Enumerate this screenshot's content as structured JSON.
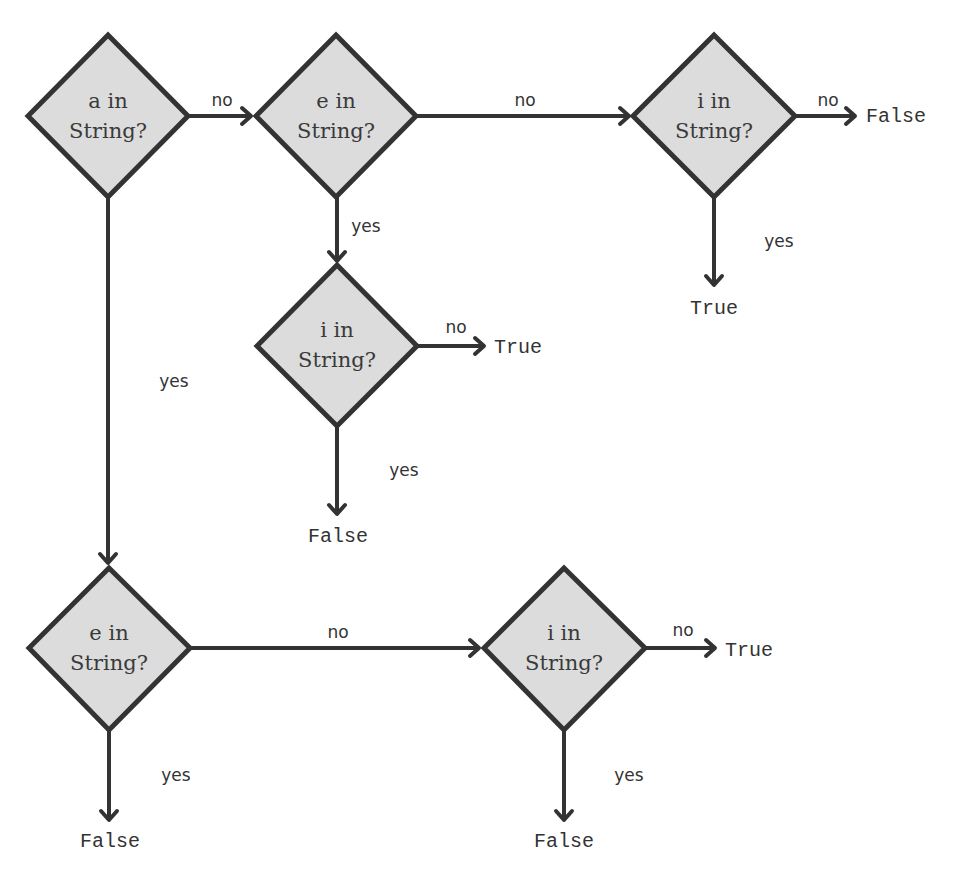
{
  "diagram": {
    "type": "flowchart",
    "colors": {
      "node_fill": "#dcdcdc",
      "node_stroke": "#333333",
      "edge": "#333333",
      "text": "#333333"
    },
    "nodes": [
      {
        "id": "n1",
        "line1": "a in",
        "line2": "String?"
      },
      {
        "id": "n2",
        "line1": "e in",
        "line2": "String?"
      },
      {
        "id": "n3",
        "line1": "i in",
        "line2": "String?"
      },
      {
        "id": "n4",
        "line1": "i in",
        "line2": "String?"
      },
      {
        "id": "n5",
        "line1": "e in",
        "line2": "String?"
      },
      {
        "id": "n6",
        "line1": "i in",
        "line2": "String?"
      }
    ],
    "edges": [
      {
        "from": "n1",
        "to": "n2",
        "label": "no"
      },
      {
        "from": "n2",
        "to": "n3",
        "label": "no"
      },
      {
        "from": "n3",
        "to": "t1",
        "label": "no"
      },
      {
        "from": "n3",
        "to": "t2",
        "label": "yes"
      },
      {
        "from": "n2",
        "to": "n4",
        "label": "yes"
      },
      {
        "from": "n4",
        "to": "t3",
        "label": "no"
      },
      {
        "from": "n4",
        "to": "t4",
        "label": "yes"
      },
      {
        "from": "n1",
        "to": "n5",
        "label": "yes"
      },
      {
        "from": "n5",
        "to": "n6",
        "label": "no"
      },
      {
        "from": "n5",
        "to": "t5",
        "label": "yes"
      },
      {
        "from": "n6",
        "to": "t6",
        "label": "no"
      },
      {
        "from": "n6",
        "to": "t7",
        "label": "yes"
      }
    ],
    "terminals": [
      {
        "id": "t1",
        "label": "False"
      },
      {
        "id": "t2",
        "label": "True"
      },
      {
        "id": "t3",
        "label": "True"
      },
      {
        "id": "t4",
        "label": "False"
      },
      {
        "id": "t5",
        "label": "False"
      },
      {
        "id": "t6",
        "label": "True"
      },
      {
        "id": "t7",
        "label": "False"
      }
    ]
  }
}
